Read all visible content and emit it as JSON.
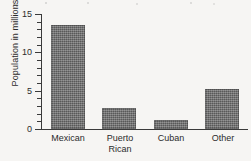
{
  "chart_data": {
    "type": "bar",
    "title": "",
    "xlabel": "",
    "ylabel": "Population in millions",
    "categories": [
      "Mexican",
      "Puerto\nRican",
      "Cuban",
      "Other"
    ],
    "category_labels_flat": [
      "Mexican",
      "Puerto Rican",
      "Cuban",
      "Other"
    ],
    "values": [
      13.5,
      2.7,
      1.2,
      5.2
    ],
    "ylim": [
      0,
      15
    ],
    "y_major_ticks": [
      0,
      5,
      10,
      15
    ],
    "y_tick_labels": [
      "0",
      "5",
      "10",
      "15"
    ],
    "y_minor_tick_interval": 1,
    "grid": false,
    "legend": null,
    "bar_color": "#6d6d6d",
    "axis_color": "#3a3a3a",
    "background_color": "#f6f5f3"
  }
}
